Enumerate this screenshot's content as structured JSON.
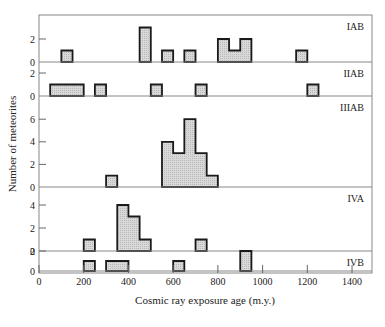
{
  "chart_data": {
    "type": "bar",
    "subtype": "stacked-panel histogram",
    "xlabel": "Cosmic ray exposure age (m.y.)",
    "ylabel": "Number of meteorites",
    "xlim": [
      0,
      1500
    ],
    "x_ticks": [
      0,
      200,
      400,
      600,
      800,
      1000,
      1200,
      1400
    ],
    "bin_width": 50,
    "fill_color": "#d4d4d4",
    "edge_color": "#1a1a1a",
    "grid": false,
    "panels": [
      {
        "name": "IAB",
        "ylim": [
          0,
          4
        ],
        "y_ticks": [
          0,
          2
        ],
        "bins": [
          {
            "x0": 100,
            "x1": 150,
            "count": 1
          },
          {
            "x0": 450,
            "x1": 500,
            "count": 3
          },
          {
            "x0": 550,
            "x1": 600,
            "count": 1
          },
          {
            "x0": 650,
            "x1": 700,
            "count": 1
          },
          {
            "x0": 800,
            "x1": 850,
            "count": 2
          },
          {
            "x0": 850,
            "x1": 900,
            "count": 1
          },
          {
            "x0": 900,
            "x1": 950,
            "count": 2
          },
          {
            "x0": 1150,
            "x1": 1200,
            "count": 1
          }
        ]
      },
      {
        "name": "IIAB",
        "ylim": [
          0,
          3
        ],
        "y_ticks": [
          0,
          2
        ],
        "bins": [
          {
            "x0": 50,
            "x1": 200,
            "count": 1
          },
          {
            "x0": 250,
            "x1": 300,
            "count": 1
          },
          {
            "x0": 500,
            "x1": 550,
            "count": 1
          },
          {
            "x0": 700,
            "x1": 750,
            "count": 1
          },
          {
            "x0": 1200,
            "x1": 1250,
            "count": 1
          }
        ]
      },
      {
        "name": "IIIAB",
        "ylim": [
          0,
          8
        ],
        "y_ticks": [
          0,
          2,
          4,
          6
        ],
        "bins": [
          {
            "x0": 300,
            "x1": 350,
            "count": 1
          },
          {
            "x0": 550,
            "x1": 600,
            "count": 4
          },
          {
            "x0": 600,
            "x1": 650,
            "count": 3
          },
          {
            "x0": 650,
            "x1": 700,
            "count": 6
          },
          {
            "x0": 700,
            "x1": 750,
            "count": 3
          },
          {
            "x0": 750,
            "x1": 800,
            "count": 1
          }
        ]
      },
      {
        "name": "IVA",
        "ylim": [
          0,
          5.5
        ],
        "y_ticks": [
          0,
          2,
          4
        ],
        "bins": [
          {
            "x0": 200,
            "x1": 250,
            "count": 1
          },
          {
            "x0": 350,
            "x1": 400,
            "count": 4
          },
          {
            "x0": 400,
            "x1": 450,
            "count": 3
          },
          {
            "x0": 450,
            "x1": 500,
            "count": 1
          },
          {
            "x0": 700,
            "x1": 750,
            "count": 1
          }
        ]
      },
      {
        "name": "IVB",
        "ylim": [
          0,
          3
        ],
        "y_ticks": [
          0,
          2
        ],
        "bins": [
          {
            "x0": 200,
            "x1": 250,
            "count": 1
          },
          {
            "x0": 300,
            "x1": 400,
            "count": 1
          },
          {
            "x0": 600,
            "x1": 650,
            "count": 1
          },
          {
            "x0": 900,
            "x1": 950,
            "count": 2
          }
        ]
      }
    ]
  },
  "layout": {
    "frame_left": 39,
    "frame_right": 372,
    "frame_top": 15,
    "frame_bottom": 273,
    "panel_baselines": [
      62,
      96,
      187,
      251,
      271
    ],
    "panel_tops": [
      15,
      62,
      96,
      187,
      251
    ],
    "unit_px": [
      11.5,
      11.5,
      11.3,
      11.5,
      10.0
    ]
  }
}
